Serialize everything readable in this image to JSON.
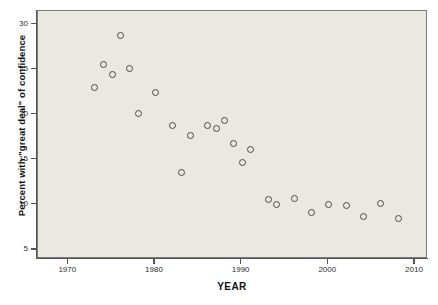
{
  "chart_data": {
    "type": "scatter",
    "title": "",
    "xlabel": "YEAR",
    "ylabel": "Percent with \"great deal\" of confidence",
    "xlim": [
      1966.5,
      2011.5
    ],
    "ylim": [
      4.0,
      31.5
    ],
    "grid": false,
    "legend": null,
    "marker_style": "open-circle",
    "xticks": [
      1970,
      1980,
      1990,
      2000,
      2010
    ],
    "xtick_labels": [
      "1970",
      "1980",
      "1990",
      "2000",
      "2010"
    ],
    "yticks": [
      5,
      10,
      15,
      20,
      25,
      30
    ],
    "ytick_labels": [
      "5",
      "10",
      "15",
      "20",
      "25",
      "30"
    ],
    "points": [
      {
        "x": 1973,
        "y": 23.1
      },
      {
        "x": 1974,
        "y": 25.6
      },
      {
        "x": 1975,
        "y": 24.5
      },
      {
        "x": 1976,
        "y": 28.8
      },
      {
        "x": 1977,
        "y": 25.2
      },
      {
        "x": 1978,
        "y": 20.2
      },
      {
        "x": 1980,
        "y": 22.5
      },
      {
        "x": 1982,
        "y": 18.9
      },
      {
        "x": 1983,
        "y": 13.6
      },
      {
        "x": 1984,
        "y": 17.8
      },
      {
        "x": 1986,
        "y": 18.9
      },
      {
        "x": 1987,
        "y": 18.5
      },
      {
        "x": 1988,
        "y": 19.4
      },
      {
        "x": 1989,
        "y": 16.9
      },
      {
        "x": 1990,
        "y": 14.8
      },
      {
        "x": 1991,
        "y": 16.2
      },
      {
        "x": 1993,
        "y": 10.7
      },
      {
        "x": 1994,
        "y": 10.1
      },
      {
        "x": 1996,
        "y": 10.8
      },
      {
        "x": 1998,
        "y": 9.2
      },
      {
        "x": 2000,
        "y": 10.1
      },
      {
        "x": 2002,
        "y": 10.0
      },
      {
        "x": 2004,
        "y": 8.8
      },
      {
        "x": 2006,
        "y": 10.2
      },
      {
        "x": 2008,
        "y": 8.5
      }
    ],
    "colors": {
      "plot_background": "#e9e9e2",
      "figure_background": "#ffffff",
      "marker_edge": "#4a4a46",
      "axis": "#55554f",
      "text": "#111111"
    }
  }
}
